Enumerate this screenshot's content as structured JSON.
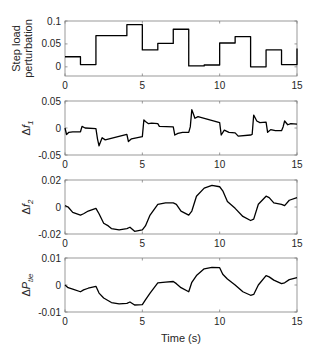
{
  "chart_data": [
    {
      "type": "line",
      "title": "",
      "ylabel": "Step load perturbation",
      "ylabel_lines": [
        "Step load",
        "perturbation"
      ],
      "xlabel": "",
      "xlim": [
        0,
        15
      ],
      "ylim": [
        -0.02,
        0.1
      ],
      "xticks": [
        0,
        5,
        10,
        15
      ],
      "yticks": [
        0,
        0.05,
        0.1
      ],
      "ytick_labels": [
        "0",
        "0.05",
        "0.1"
      ],
      "grid": false,
      "step": true,
      "x": [
        0,
        1,
        2,
        3,
        4,
        5,
        6,
        7,
        8,
        9,
        10,
        11,
        12,
        13,
        14,
        15
      ],
      "values": [
        0.022,
        0.005,
        0.068,
        0.068,
        0.092,
        0.037,
        0.051,
        0.082,
        0.002,
        0.004,
        0.052,
        0.066,
        0.0,
        0.037,
        0.005,
        0.04
      ]
    },
    {
      "type": "line",
      "ylabel": "Δf1",
      "ylabel_main": "Δf",
      "ylabel_sub": "1",
      "xlim": [
        0,
        15
      ],
      "ylim": [
        -0.05,
        0.05
      ],
      "xticks": [
        0,
        5,
        10,
        15
      ],
      "yticks": [
        -0.05,
        0,
        0.05
      ],
      "ytick_labels": [
        "-0.05",
        "0",
        "0.05"
      ],
      "grid": false,
      "x": [
        0,
        0.1,
        0.25,
        0.5,
        1.0,
        1.1,
        1.3,
        2.0,
        2.1,
        2.2,
        2.4,
        2.6,
        4.0,
        4.1,
        4.3,
        5.0,
        5.1,
        5.2,
        5.4,
        5.6,
        6.0,
        6.1,
        7.0,
        7.1,
        7.3,
        7.6,
        8.0,
        8.1,
        8.2,
        8.4,
        8.6,
        10.0,
        10.1,
        10.3,
        10.6,
        11.0,
        11.2,
        12.0,
        12.1,
        12.2,
        12.4,
        12.6,
        13.0,
        13.1,
        13.3,
        13.6,
        14.0,
        14.1,
        14.2,
        14.4,
        14.6,
        15.0
      ],
      "values": [
        0.0,
        -0.012,
        -0.008,
        -0.007,
        -0.007,
        0.003,
        0.0,
        -0.001,
        -0.02,
        -0.033,
        -0.018,
        -0.022,
        -0.012,
        -0.025,
        -0.02,
        -0.016,
        0.015,
        0.012,
        0.008,
        0.009,
        0.008,
        0.003,
        0.002,
        -0.013,
        -0.01,
        -0.008,
        -0.008,
        0.002,
        0.034,
        0.018,
        0.021,
        0.01,
        -0.013,
        -0.004,
        -0.008,
        -0.009,
        -0.015,
        -0.013,
        -0.012,
        0.024,
        0.013,
        0.01,
        0.011,
        -0.008,
        -0.003,
        -0.005,
        -0.005,
        0.002,
        0.013,
        0.006,
        0.008,
        0.007
      ]
    },
    {
      "type": "line",
      "ylabel": "Δf2",
      "ylabel_main": "Δf",
      "ylabel_sub": "2",
      "xlim": [
        0,
        15
      ],
      "ylim": [
        -0.02,
        0.02
      ],
      "xticks": [
        0,
        5,
        10,
        15
      ],
      "yticks": [
        -0.02,
        0,
        0.02
      ],
      "ytick_labels": [
        "-0.02",
        "0",
        "0.02"
      ],
      "grid": false,
      "x": [
        0,
        0.2,
        0.5,
        1.0,
        1.2,
        1.5,
        2.0,
        2.2,
        2.5,
        2.8,
        3.0,
        3.5,
        4.0,
        4.2,
        4.5,
        5.0,
        5.2,
        5.5,
        6.0,
        6.5,
        7.0,
        7.2,
        7.5,
        8.0,
        8.2,
        8.5,
        9.0,
        9.5,
        10.0,
        10.2,
        10.5,
        11.0,
        11.5,
        12.0,
        12.2,
        12.5,
        13.0,
        13.2,
        13.5,
        14.0,
        14.2,
        14.5,
        15.0
      ],
      "values": [
        0.001,
        0.0,
        -0.004,
        -0.006,
        -0.005,
        -0.003,
        -0.001,
        -0.005,
        -0.012,
        -0.014,
        -0.016,
        -0.017,
        -0.016,
        -0.015,
        -0.018,
        -0.017,
        -0.014,
        -0.006,
        0.002,
        0.003,
        0.003,
        0.002,
        -0.003,
        -0.006,
        -0.003,
        0.008,
        0.014,
        0.016,
        0.015,
        0.012,
        0.004,
        -0.001,
        -0.007,
        -0.01,
        -0.009,
        0.002,
        0.008,
        0.007,
        0.003,
        0.002,
        0.001,
        0.005,
        0.007
      ]
    },
    {
      "type": "line",
      "ylabel": "ΔPtie",
      "ylabel_main": "ΔP",
      "ylabel_sub": "tie",
      "xlabel": "Time (s)",
      "xlim": [
        0,
        15
      ],
      "ylim": [
        -0.01,
        0.01
      ],
      "xticks": [
        0,
        5,
        10,
        15
      ],
      "yticks": [
        -0.01,
        0,
        0.01
      ],
      "ytick_labels": [
        "-0.01",
        "0",
        "0.01"
      ],
      "grid": false,
      "x": [
        0,
        0.2,
        0.5,
        1.0,
        1.2,
        1.5,
        2.0,
        2.2,
        2.5,
        3.0,
        3.5,
        4.0,
        4.2,
        4.5,
        5.0,
        5.2,
        5.5,
        6.0,
        6.5,
        7.0,
        7.2,
        7.5,
        8.0,
        8.2,
        8.5,
        9.0,
        9.5,
        10.0,
        10.2,
        10.5,
        11.0,
        11.5,
        12.0,
        12.2,
        12.5,
        13.0,
        13.2,
        13.5,
        14.0,
        14.2,
        14.5,
        15.0
      ],
      "values": [
        0.0,
        -0.001,
        -0.0015,
        -0.0025,
        -0.0018,
        -0.0012,
        -0.0005,
        -0.003,
        -0.0048,
        -0.0065,
        -0.007,
        -0.0068,
        -0.0063,
        -0.0074,
        -0.0073,
        -0.0055,
        -0.003,
        0.0008,
        0.0011,
        0.0013,
        0.0005,
        -0.001,
        -0.0025,
        0.001,
        0.0035,
        0.006,
        0.0065,
        0.0064,
        0.004,
        0.0022,
        0.0,
        -0.0025,
        -0.0038,
        -0.0035,
        0.0,
        0.0035,
        0.003,
        0.0018,
        0.0005,
        0.0008,
        0.002,
        0.0027
      ]
    }
  ],
  "layout": {
    "panels": [
      {
        "top": 21,
        "bottom": 76
      },
      {
        "top": 101,
        "bottom": 155
      },
      {
        "top": 180,
        "bottom": 234
      },
      {
        "top": 258,
        "bottom": 312
      }
    ],
    "left": 65,
    "right": 297,
    "xtick_labels": [
      "0",
      "5",
      "10",
      "15"
    ]
  },
  "colors": {
    "trace": "#000000",
    "axis": "#808080",
    "text": "#262626"
  }
}
